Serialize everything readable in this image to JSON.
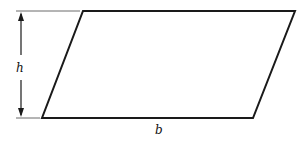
{
  "diagram": {
    "shape": "parallelogram",
    "labels": {
      "height": "h",
      "base": "b"
    },
    "vertices": {
      "top_left": [
        83,
        11
      ],
      "top_right": [
        295,
        11
      ],
      "bottom_right": [
        253,
        118
      ],
      "bottom_left": [
        42,
        118
      ]
    },
    "colors": {
      "stroke": "#1a1a1a",
      "background": "#ffffff"
    }
  }
}
